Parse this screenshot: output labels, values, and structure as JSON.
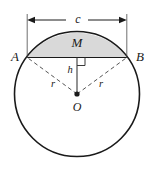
{
  "figure": {
    "type": "geometry-diagram",
    "background_color": "#ffffff",
    "stroke_color": "#1a1a1a",
    "segment_fill_color": "#d9d9d9",
    "dashed_color": "#555555"
  },
  "labels": {
    "chord_length": "c",
    "point_a": "A",
    "point_b": "B",
    "segment_area": "M",
    "height": "h",
    "radius_left": "r",
    "radius_right": "r",
    "center": "O"
  },
  "geometry": {
    "circle": {
      "center_x": 77,
      "center_y": 94,
      "radius": 62.5
    },
    "chord": {
      "y": 57.5,
      "x_left": 27.2,
      "x_right": 126.8
    },
    "dimension_line": {
      "y": 20,
      "x_left": 27.2,
      "x_right": 126.8,
      "extension_top": 14
    },
    "right_angle_marker": {
      "x": 77,
      "y": 57.5,
      "size": 8
    },
    "center_dot_radius": 2.6
  }
}
